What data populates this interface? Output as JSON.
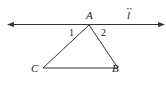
{
  "diagram": {
    "line": {
      "label": "l",
      "arrow_symbol": "↔"
    },
    "vertices": {
      "A": "A",
      "B": "B",
      "C": "C"
    },
    "angles": {
      "one": "1",
      "two": "2"
    },
    "stroke_color": "#222222"
  }
}
